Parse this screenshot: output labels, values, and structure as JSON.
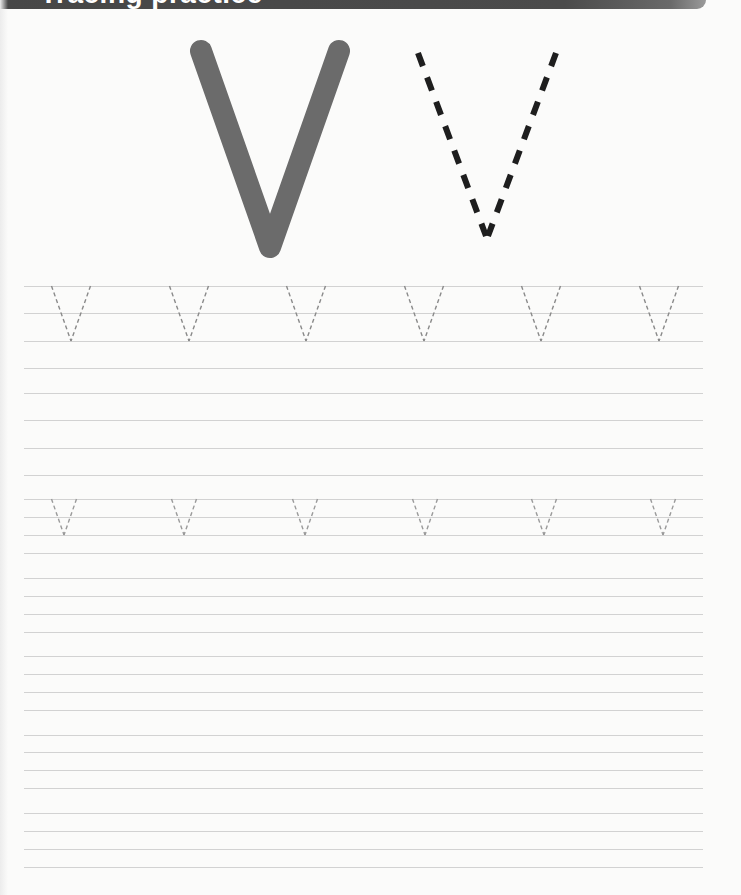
{
  "header": {
    "title": "Tracing practice",
    "banner_color": "#4a4a4a"
  },
  "model_letters": {
    "solid": {
      "letter": "V",
      "color": "#6b6b6b",
      "style": "solid-stroke"
    },
    "dashed": {
      "letter": "V",
      "color": "#1e1e1e",
      "style": "dashed-stroke"
    }
  },
  "guide_lines": {
    "color": "#d2d2d2",
    "x_start": 24,
    "x_end": 703,
    "y_positions": [
      286,
      313,
      341,
      368,
      393,
      420,
      448,
      475,
      499,
      517,
      535,
      553,
      578,
      596,
      614,
      632,
      656,
      674,
      692,
      710,
      735,
      752,
      770,
      788,
      813,
      831,
      849,
      867
    ]
  },
  "tracing_rows": [
    {
      "name": "uppercase-row",
      "letter": "V",
      "top_y": 286,
      "bottom_y": 341,
      "half_width": 19.5,
      "centers_x": [
        71,
        189,
        306,
        424,
        541,
        659
      ],
      "color": "#8a8a8a"
    },
    {
      "name": "lowercase-row",
      "letter": "v",
      "top_y": 499,
      "bottom_y": 535,
      "half_width": 12.5,
      "centers_x": [
        64,
        184,
        305,
        425,
        544,
        663
      ],
      "color": "#9a9a9a"
    }
  ]
}
